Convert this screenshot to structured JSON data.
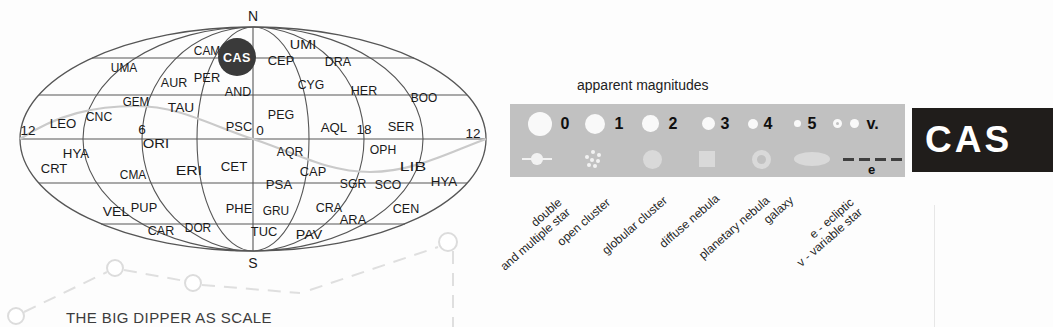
{
  "map": {
    "north_label": "N",
    "south_label": "S",
    "highlight": {
      "label": "CAS",
      "x": 237,
      "y": 57,
      "r": 19,
      "bg": "#3a3a3a",
      "fg": "#ffffff"
    },
    "hour_labels": [
      {
        "label": "12",
        "x": 28,
        "y": 135
      },
      {
        "label": "6",
        "x": 142,
        "y": 134
      },
      {
        "label": "0",
        "x": 260,
        "y": 135
      },
      {
        "label": "18",
        "x": 364,
        "y": 134
      },
      {
        "label": "12",
        "x": 473,
        "y": 138
      }
    ],
    "constellations": [
      {
        "label": "CAM",
        "x": 207,
        "y": 50
      },
      {
        "label": "UMI",
        "x": 303,
        "y": 44
      },
      {
        "label": "CEP",
        "x": 281,
        "y": 60
      },
      {
        "label": "DRA",
        "x": 338,
        "y": 61
      },
      {
        "label": "UMA",
        "x": 124,
        "y": 67
      },
      {
        "label": "AUR",
        "x": 174,
        "y": 82
      },
      {
        "label": "PER",
        "x": 207,
        "y": 77
      },
      {
        "label": "AND",
        "x": 238,
        "y": 91
      },
      {
        "label": "CYG",
        "x": 311,
        "y": 84
      },
      {
        "label": "HER",
        "x": 364,
        "y": 90
      },
      {
        "label": "BOO",
        "x": 424,
        "y": 97
      },
      {
        "label": "GEM",
        "x": 136,
        "y": 101
      },
      {
        "label": "TAU",
        "x": 181,
        "y": 107
      },
      {
        "label": "PEG",
        "x": 281,
        "y": 114
      },
      {
        "label": "CNC",
        "x": 99,
        "y": 116
      },
      {
        "label": "LEO",
        "x": 63,
        "y": 123
      },
      {
        "label": "PSC",
        "x": 239,
        "y": 126
      },
      {
        "label": "AQL",
        "x": 334,
        "y": 127
      },
      {
        "label": "SER",
        "x": 401,
        "y": 126
      },
      {
        "label": "ORI",
        "x": 156,
        "y": 143
      },
      {
        "label": "HYA",
        "x": 76,
        "y": 153
      },
      {
        "label": "AQR",
        "x": 290,
        "y": 151
      },
      {
        "label": "OPH",
        "x": 383,
        "y": 149
      },
      {
        "label": "CRT",
        "x": 54,
        "y": 168
      },
      {
        "label": "CMA",
        "x": 133,
        "y": 174
      },
      {
        "label": "ERI",
        "x": 189,
        "y": 170
      },
      {
        "label": "CET",
        "x": 234,
        "y": 166
      },
      {
        "label": "CAP",
        "x": 313,
        "y": 171
      },
      {
        "label": "LIB",
        "x": 413,
        "y": 166
      },
      {
        "label": "HYA",
        "x": 444,
        "y": 181
      },
      {
        "label": "PSA",
        "x": 279,
        "y": 184
      },
      {
        "label": "SGR",
        "x": 353,
        "y": 183
      },
      {
        "label": "SCO",
        "x": 388,
        "y": 184
      },
      {
        "label": "VEL",
        "x": 116,
        "y": 211
      },
      {
        "label": "PUP",
        "x": 144,
        "y": 207
      },
      {
        "label": "PHE",
        "x": 239,
        "y": 208
      },
      {
        "label": "GRU",
        "x": 276,
        "y": 210
      },
      {
        "label": "CRA",
        "x": 329,
        "y": 207
      },
      {
        "label": "ARA",
        "x": 353,
        "y": 219
      },
      {
        "label": "CEN",
        "x": 406,
        "y": 208
      },
      {
        "label": "CAR",
        "x": 161,
        "y": 230
      },
      {
        "label": "DOR",
        "x": 198,
        "y": 227
      },
      {
        "label": "TUC",
        "x": 264,
        "y": 231
      },
      {
        "label": "PAV",
        "x": 309,
        "y": 234
      }
    ]
  },
  "caption": "THE BIG DIPPER AS SCALE",
  "legend": {
    "title": "apparent magnitudes",
    "magnitudes": [
      {
        "label": "0",
        "x": 540,
        "label_x": 565,
        "d": 24
      },
      {
        "label": "1",
        "x": 595,
        "label_x": 619,
        "d": 20
      },
      {
        "label": "2",
        "x": 650.5,
        "label_x": 673,
        "d": 16.5
      },
      {
        "label": "3",
        "x": 708,
        "label_x": 725,
        "d": 13
      },
      {
        "label": "4",
        "x": 753,
        "label_x": 768,
        "d": 10
      },
      {
        "label": "5",
        "x": 797,
        "label_x": 812,
        "d": 7
      }
    ],
    "variable": {
      "label": "v.",
      "x_ring": 837.5,
      "x_dot": 854.5,
      "label_x": 872.5,
      "d": 9.5
    },
    "symbols": [
      {
        "type": "double-star",
        "x": 537,
        "ax": 556,
        "ay": 196,
        "label": "double",
        "label2": "and multiple star"
      },
      {
        "type": "open-cluster",
        "x": 593,
        "ax": 604,
        "ay": 196,
        "label": "open cluster"
      },
      {
        "type": "globular-cluster",
        "x": 652,
        "ax": 661,
        "ay": 194,
        "label": "globular cluster"
      },
      {
        "type": "diffuse-nebula",
        "x": 707,
        "ax": 714,
        "ay": 192,
        "label": "diffuse nebula"
      },
      {
        "type": "planetary-nebula",
        "x": 761,
        "ax": 764,
        "ay": 194,
        "label": "planetary nebula"
      },
      {
        "type": "galaxy",
        "x": 812,
        "ax": 788,
        "ay": 194,
        "label": "galaxy"
      },
      {
        "type": "ecliptic",
        "x": 872,
        "ax": 848,
        "ay": 196,
        "label": "e - ecliptic",
        "label2": "v - variable star",
        "marker": "e",
        "marker_x": 868
      }
    ],
    "colors": {
      "panel": "#c1c1c1",
      "symbol_fill": "#d9d9d9",
      "star_fill": "#f9f9f9",
      "dash": "#3f3f3f"
    }
  },
  "badge": {
    "label": "CAS",
    "bg": "#201d1b",
    "fg": "#ffffff"
  }
}
